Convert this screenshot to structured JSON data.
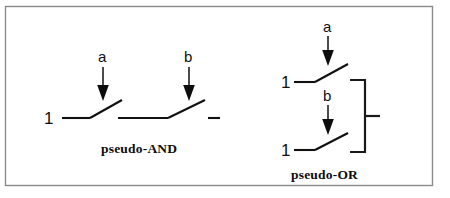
{
  "figure": {
    "background_color": "#ffffff",
    "frame": {
      "stroke_color": "#8a8a8a",
      "x": 5,
      "y": 6,
      "width": 428,
      "height": 180
    },
    "line_color": "#111111",
    "diagrams": [
      {
        "id": "pseudo-and",
        "caption": "pseudo-AND",
        "topology": "series",
        "supply_labels": [
          "1"
        ],
        "control_inputs": [
          "a",
          "b"
        ],
        "switches": [
          {
            "control": "a",
            "supply_label": "1",
            "state": "open"
          },
          {
            "control": "b",
            "supply_label": "",
            "state": "open"
          }
        ],
        "output_terminal": true
      },
      {
        "id": "pseudo-or",
        "caption": "pseudo-OR",
        "topology": "parallel",
        "supply_labels": [
          "1",
          "1"
        ],
        "control_inputs": [
          "a",
          "b"
        ],
        "switches": [
          {
            "control": "a",
            "supply_label": "1",
            "state": "open"
          },
          {
            "control": "b",
            "supply_label": "1",
            "state": "open"
          }
        ],
        "output_terminal": true
      }
    ]
  },
  "labels": {
    "and_input_a": "a",
    "and_input_b": "b",
    "and_supply": "1",
    "and_caption": "pseudo-AND",
    "or_input_a": "a",
    "or_input_b": "b",
    "or_supply_top": "1",
    "or_supply_bottom": "1",
    "or_caption": "pseudo-OR"
  }
}
